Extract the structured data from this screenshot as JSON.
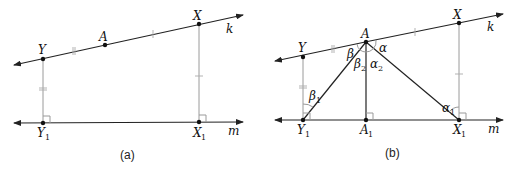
{
  "figure": {
    "panels": [
      {
        "caption": "(a)",
        "points": {
          "Y": "Y",
          "A": "A",
          "X": "X",
          "Y1": "Y",
          "X1": "X"
        },
        "lines": {
          "k": "k",
          "m": "m"
        },
        "subscripts": {
          "Y1": "1",
          "X1": "1"
        }
      },
      {
        "caption": "(b)",
        "points": {
          "Y": "Y",
          "A": "A",
          "X": "X",
          "Y1": "Y",
          "A1": "A",
          "X1": "X"
        },
        "lines": {
          "k": "k",
          "m": "m"
        },
        "subscripts": {
          "Y1": "1",
          "A1": "1",
          "X1": "1"
        },
        "angles": {
          "beta": "β",
          "alpha": "α",
          "beta2": "β",
          "alpha2": "α",
          "beta1": "β",
          "alpha1": "α",
          "beta2_sub": "2",
          "alpha2_sub": "2",
          "beta1_sub": "1",
          "alpha1_sub": "1"
        }
      }
    ]
  },
  "colors": {
    "line": "#222222",
    "perpendicular": "#9a9a9a"
  }
}
